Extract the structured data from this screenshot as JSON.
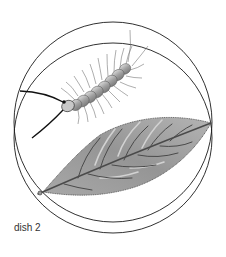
{
  "figure": {
    "caption": "dish 2",
    "elements": [
      "petri-dish",
      "centipede",
      "leaf"
    ],
    "colors": {
      "outline": "#1a1a1a",
      "leaf_fill": "#9a9a9a",
      "leaf_highlight": "#c8c8c8",
      "vein": "#4a4a4a",
      "body_segment": "#b0b0b0"
    }
  }
}
